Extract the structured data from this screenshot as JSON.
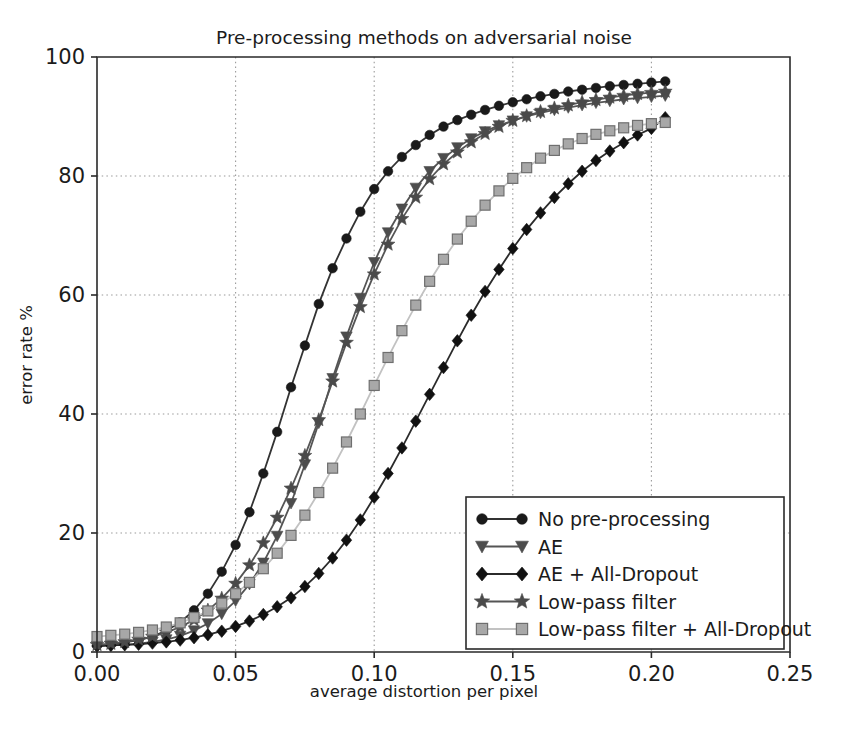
{
  "chart_data": {
    "type": "line",
    "title": "Pre-processing methods on adversarial noise",
    "xlabel": "average distortion per pixel",
    "ylabel": "error rate %",
    "xlim": [
      0.0,
      0.25
    ],
    "ylim": [
      0,
      100
    ],
    "xticks": [
      "0.00",
      "0.05",
      "0.10",
      "0.15",
      "0.20",
      "0.25"
    ],
    "xtick_values": [
      0.0,
      0.05,
      0.1,
      0.15,
      0.2,
      0.25
    ],
    "yticks": [
      "0",
      "20",
      "40",
      "60",
      "80",
      "100"
    ],
    "ytick_values": [
      0,
      20,
      40,
      60,
      80,
      100
    ],
    "grid": true,
    "legend_position": "lower right",
    "series": [
      {
        "name": "No pre-processing",
        "marker": "circle",
        "color": "#1a1a1a",
        "line_color": "#333333",
        "x": [
          0.0,
          0.005,
          0.01,
          0.015,
          0.02,
          0.025,
          0.03,
          0.035,
          0.04,
          0.045,
          0.05,
          0.055,
          0.06,
          0.065,
          0.07,
          0.075,
          0.08,
          0.085,
          0.09,
          0.095,
          0.1,
          0.105,
          0.11,
          0.115,
          0.12,
          0.125,
          0.13,
          0.135,
          0.14,
          0.145,
          0.15,
          0.155,
          0.16,
          0.165,
          0.17,
          0.175,
          0.18,
          0.185,
          0.19,
          0.195,
          0.2,
          0.205
        ],
        "y": [
          1.1,
          1.3,
          1.6,
          2.0,
          2.6,
          3.6,
          5.0,
          7.0,
          9.8,
          13.5,
          18.0,
          23.5,
          30.0,
          37.0,
          44.5,
          51.5,
          58.5,
          64.5,
          69.5,
          74.0,
          77.8,
          80.8,
          83.2,
          85.2,
          86.9,
          88.3,
          89.4,
          90.3,
          91.1,
          91.8,
          92.4,
          92.9,
          93.4,
          93.8,
          94.2,
          94.5,
          94.8,
          95.1,
          95.3,
          95.5,
          95.7,
          95.9
        ]
      },
      {
        "name": "AE",
        "marker": "triangle-down",
        "color": "#4d4d4d",
        "line_color": "#555555",
        "x": [
          0.0,
          0.005,
          0.01,
          0.015,
          0.02,
          0.025,
          0.03,
          0.035,
          0.04,
          0.045,
          0.05,
          0.055,
          0.06,
          0.065,
          0.07,
          0.075,
          0.08,
          0.085,
          0.09,
          0.095,
          0.1,
          0.105,
          0.11,
          0.115,
          0.12,
          0.125,
          0.13,
          0.135,
          0.14,
          0.145,
          0.15,
          0.155,
          0.16,
          0.165,
          0.17,
          0.175,
          0.18,
          0.185,
          0.19,
          0.195,
          0.2,
          0.205
        ],
        "y": [
          1.0,
          1.1,
          1.2,
          1.4,
          1.7,
          2.1,
          2.7,
          3.6,
          4.8,
          6.4,
          8.6,
          11.4,
          15.0,
          19.5,
          25.0,
          31.5,
          38.5,
          46.0,
          53.0,
          59.5,
          65.5,
          70.5,
          74.5,
          78.0,
          80.8,
          83.0,
          84.8,
          86.3,
          87.5,
          88.5,
          89.3,
          90.0,
          90.6,
          91.1,
          91.5,
          91.9,
          92.3,
          92.6,
          92.9,
          93.1,
          93.3,
          93.5
        ]
      },
      {
        "name": "AE + All-Dropout",
        "marker": "diamond",
        "color": "#111111",
        "line_color": "#2b2b2b",
        "x": [
          0.0,
          0.005,
          0.01,
          0.015,
          0.02,
          0.025,
          0.03,
          0.035,
          0.04,
          0.045,
          0.05,
          0.055,
          0.06,
          0.065,
          0.07,
          0.075,
          0.08,
          0.085,
          0.09,
          0.095,
          0.1,
          0.105,
          0.11,
          0.115,
          0.12,
          0.125,
          0.13,
          0.135,
          0.14,
          0.145,
          0.15,
          0.155,
          0.16,
          0.165,
          0.17,
          0.175,
          0.18,
          0.185,
          0.19,
          0.195,
          0.2,
          0.205
        ],
        "y": [
          1.0,
          1.1,
          1.2,
          1.3,
          1.5,
          1.7,
          2.0,
          2.4,
          2.9,
          3.5,
          4.3,
          5.2,
          6.3,
          7.6,
          9.1,
          11.0,
          13.2,
          15.8,
          18.8,
          22.2,
          26.0,
          30.0,
          34.3,
          38.8,
          43.3,
          47.8,
          52.3,
          56.6,
          60.6,
          64.3,
          67.8,
          71.0,
          73.8,
          76.4,
          78.7,
          80.8,
          82.6,
          84.2,
          85.6,
          86.9,
          88.0,
          89.8
        ]
      },
      {
        "name": "Low-pass filter",
        "marker": "star",
        "color": "#4a4a4a",
        "line_color": "#555555",
        "x": [
          0.0,
          0.005,
          0.01,
          0.015,
          0.02,
          0.025,
          0.03,
          0.035,
          0.04,
          0.045,
          0.05,
          0.055,
          0.06,
          0.065,
          0.07,
          0.075,
          0.08,
          0.085,
          0.09,
          0.095,
          0.1,
          0.105,
          0.11,
          0.115,
          0.12,
          0.125,
          0.13,
          0.135,
          0.14,
          0.145,
          0.15,
          0.155,
          0.16,
          0.165,
          0.17,
          0.175,
          0.18,
          0.185,
          0.19,
          0.195,
          0.2,
          0.205
        ],
        "y": [
          1.2,
          1.4,
          1.7,
          2.1,
          2.6,
          3.3,
          4.2,
          5.4,
          7.0,
          9.0,
          11.5,
          14.6,
          18.3,
          22.6,
          27.5,
          33.0,
          39.0,
          45.5,
          52.0,
          58.0,
          63.5,
          68.5,
          72.8,
          76.4,
          79.5,
          82.0,
          84.0,
          85.7,
          87.1,
          88.3,
          89.3,
          90.1,
          90.8,
          91.4,
          91.9,
          92.4,
          92.8,
          93.2,
          93.5,
          93.8,
          94.0,
          94.2
        ]
      },
      {
        "name": "Low-pass filter + All-Dropout",
        "marker": "square",
        "color": "#a8a8a8",
        "line_color": "#c2c2c2",
        "x": [
          0.0,
          0.005,
          0.01,
          0.015,
          0.02,
          0.025,
          0.03,
          0.035,
          0.04,
          0.045,
          0.05,
          0.055,
          0.06,
          0.065,
          0.07,
          0.075,
          0.08,
          0.085,
          0.09,
          0.095,
          0.1,
          0.105,
          0.11,
          0.115,
          0.12,
          0.125,
          0.13,
          0.135,
          0.14,
          0.145,
          0.15,
          0.155,
          0.16,
          0.165,
          0.17,
          0.175,
          0.18,
          0.185,
          0.19,
          0.195,
          0.2,
          0.205
        ],
        "y": [
          2.6,
          2.8,
          3.0,
          3.3,
          3.7,
          4.2,
          4.9,
          5.8,
          6.9,
          8.2,
          9.8,
          11.7,
          14.0,
          16.6,
          19.6,
          23.0,
          26.8,
          30.9,
          35.3,
          40.0,
          44.8,
          49.5,
          54.0,
          58.3,
          62.3,
          66.0,
          69.4,
          72.4,
          75.1,
          77.5,
          79.6,
          81.4,
          83.0,
          84.3,
          85.4,
          86.3,
          87.0,
          87.6,
          88.1,
          88.5,
          88.8,
          89.0
        ]
      }
    ]
  },
  "legend": {
    "entries": [
      "No pre-processing",
      "AE",
      "AE + All-Dropout",
      "Low-pass filter",
      "Low-pass filter + All-Dropout"
    ]
  }
}
